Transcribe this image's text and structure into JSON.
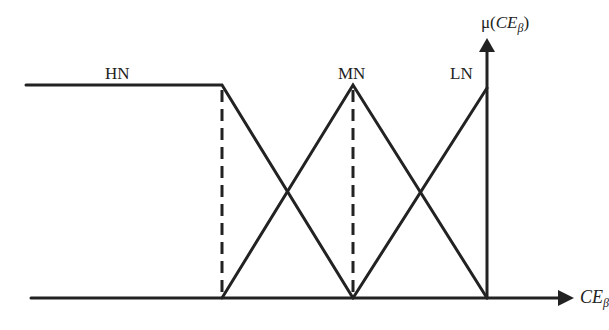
{
  "diagram": {
    "title": "",
    "sets": [
      {
        "name": "HN",
        "shape": "left-shoulder trapezoid"
      },
      {
        "name": "MN",
        "shape": "triangle"
      },
      {
        "name": "LN",
        "shape": "right ramp"
      }
    ],
    "labels": {
      "hn": "HN",
      "mn": "MN",
      "ln": "LN",
      "y_axis_mu": "μ(",
      "y_axis_var": "CE",
      "y_axis_sub": "β",
      "y_axis_close": ")",
      "x_axis_var": "CE",
      "x_axis_sub": "β"
    },
    "colors": {
      "line": "#222222",
      "background": "#ffffff"
    }
  }
}
